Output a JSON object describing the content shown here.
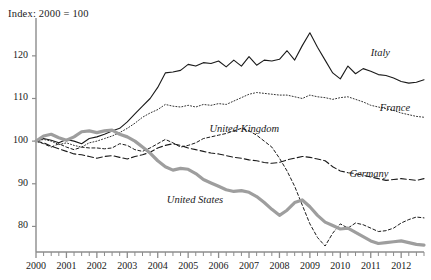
{
  "chart_data": {
    "type": "line",
    "title": "Index: 2000 = 100",
    "xlabel": "",
    "ylabel": "",
    "ylim": [
      74,
      127
    ],
    "xlim": [
      2000,
      2012.75
    ],
    "grid": false,
    "legend_position": "inline-right",
    "y_ticks": [
      80,
      90,
      100,
      110,
      120
    ],
    "x_ticks": [
      "2000",
      "2001",
      "2002",
      "2003",
      "2004",
      "2005",
      "2006",
      "2007",
      "2008",
      "2009",
      "2010",
      "2011",
      "2012"
    ],
    "x_minor_ticks_per_year": 4,
    "x": [
      2000.0,
      2000.25,
      2000.5,
      2000.75,
      2001.0,
      2001.25,
      2001.5,
      2001.75,
      2002.0,
      2002.25,
      2002.5,
      2002.75,
      2003.0,
      2003.25,
      2003.5,
      2003.75,
      2004.0,
      2004.25,
      2004.5,
      2004.75,
      2005.0,
      2005.25,
      2005.5,
      2005.75,
      2006.0,
      2006.25,
      2006.5,
      2006.75,
      2007.0,
      2007.25,
      2007.5,
      2007.75,
      2008.0,
      2008.25,
      2008.5,
      2008.75,
      2009.0,
      2009.25,
      2009.5,
      2009.75,
      2010.0,
      2010.25,
      2010.5,
      2010.75,
      2011.0,
      2011.25,
      2011.5,
      2011.75,
      2012.0,
      2012.25,
      2012.5,
      2012.75
    ],
    "series": [
      {
        "name": "Italy",
        "style": "solid",
        "color": "#1a1a1a",
        "width": 1.1,
        "label_x": 2011.0,
        "label_y": 120.5,
        "values": [
          100.0,
          100.6,
          100.2,
          99.6,
          100.4,
          100.0,
          99.4,
          100.6,
          101.0,
          101.6,
          102.4,
          103.0,
          104.5,
          106.4,
          108.2,
          110.0,
          112.6,
          116.0,
          116.2,
          116.6,
          118.0,
          117.6,
          118.4,
          118.2,
          118.8,
          117.4,
          119.0,
          117.6,
          119.8,
          117.8,
          119.0,
          118.8,
          119.2,
          121.2,
          119.0,
          122.4,
          125.4,
          122.0,
          119.0,
          116.0,
          114.6,
          117.6,
          115.8,
          117.0,
          116.4,
          115.6,
          115.4,
          114.8,
          114.0,
          113.6,
          113.8,
          114.4
        ]
      },
      {
        "name": "France",
        "style": "dotted",
        "color": "#333333",
        "width": 1.0,
        "label_x": 2011.3,
        "label_y": 107.5,
        "values": [
          100.0,
          100.4,
          100.0,
          99.2,
          99.6,
          99.0,
          98.6,
          99.6,
          100.0,
          100.6,
          101.2,
          102.0,
          103.0,
          104.2,
          105.6,
          106.6,
          107.4,
          108.6,
          108.2,
          108.0,
          108.4,
          108.0,
          108.6,
          108.4,
          108.8,
          108.6,
          109.4,
          110.2,
          111.0,
          111.4,
          111.2,
          111.0,
          110.8,
          110.8,
          110.4,
          110.0,
          110.8,
          110.4,
          110.2,
          109.8,
          110.2,
          110.4,
          109.8,
          109.2,
          108.4,
          108.0,
          107.6,
          107.2,
          106.6,
          106.2,
          105.8,
          105.6
        ]
      },
      {
        "name": "United Kingdom",
        "style": "fine-dash",
        "color": "#1a1a1a",
        "width": 1.0,
        "label_x": 2005.7,
        "label_y": 102.5,
        "values": [
          100.0,
          99.4,
          98.6,
          99.4,
          98.6,
          98.0,
          98.6,
          98.4,
          98.4,
          98.2,
          98.4,
          99.4,
          99.0,
          98.0,
          97.6,
          98.4,
          99.4,
          100.4,
          99.6,
          98.6,
          99.0,
          99.6,
          100.6,
          101.0,
          101.4,
          101.8,
          102.4,
          103.0,
          102.4,
          101.4,
          100.0,
          98.6,
          96.0,
          93.0,
          89.4,
          85.0,
          80.6,
          77.4,
          75.4,
          78.4,
          80.6,
          79.6,
          80.8,
          80.4,
          79.6,
          78.8,
          79.0,
          79.6,
          80.8,
          81.6,
          82.2,
          82.0
        ]
      },
      {
        "name": "Germany",
        "style": "long-dash",
        "color": "#1a1a1a",
        "width": 1.1,
        "label_x": 2010.3,
        "label_y": 92.0,
        "values": [
          100.0,
          99.6,
          98.8,
          98.2,
          97.6,
          97.0,
          96.8,
          96.4,
          96.0,
          96.4,
          96.6,
          96.2,
          95.8,
          96.4,
          96.8,
          97.4,
          98.4,
          99.0,
          99.4,
          99.0,
          98.4,
          98.0,
          97.6,
          97.2,
          97.0,
          96.6,
          96.2,
          96.0,
          95.6,
          95.4,
          95.0,
          94.8,
          95.0,
          95.6,
          96.0,
          96.4,
          96.2,
          95.8,
          95.4,
          94.0,
          93.0,
          92.6,
          92.4,
          92.0,
          91.6,
          91.2,
          90.8,
          91.0,
          91.2,
          91.0,
          90.8,
          91.2
        ]
      },
      {
        "name": "United States",
        "style": "thick-gray",
        "color": "#9e9e9e",
        "width": 3.2,
        "label_x": 2004.3,
        "label_y": 86.0,
        "values": [
          100.0,
          101.2,
          101.6,
          100.8,
          100.2,
          101.0,
          102.2,
          102.4,
          102.0,
          102.4,
          102.6,
          101.6,
          101.0,
          100.0,
          98.6,
          97.2,
          95.4,
          94.0,
          93.2,
          93.6,
          93.4,
          92.4,
          91.0,
          90.2,
          89.4,
          88.6,
          88.2,
          88.4,
          88.0,
          87.0,
          85.6,
          84.0,
          82.6,
          83.8,
          85.6,
          86.2,
          84.6,
          82.6,
          81.0,
          80.2,
          79.4,
          79.6,
          78.6,
          77.6,
          76.6,
          76.0,
          76.2,
          76.4,
          76.6,
          76.2,
          75.8,
          75.6
        ]
      }
    ]
  },
  "axis": {
    "line_color": "#8c8c8c",
    "tick_color": "#8c8c8c"
  }
}
